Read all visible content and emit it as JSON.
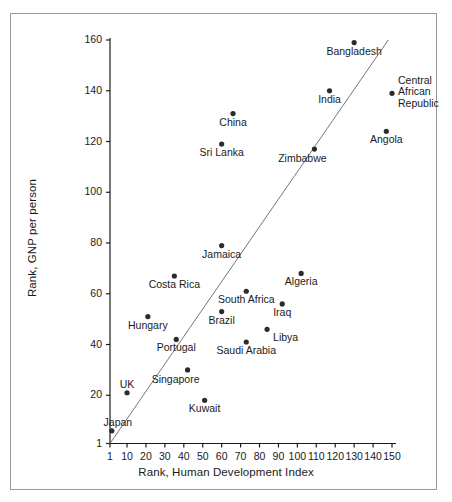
{
  "figure": {
    "background_color": "#ffffff",
    "frame_color": "#9a9a9a",
    "ink_color": "#1a1a1a",
    "marker_color": "#2b2b2b",
    "trend_line_color": "#767676"
  },
  "chart_data": {
    "type": "scatter",
    "title": "",
    "xlabel": "Rank, Human Development Index",
    "ylabel": "Rank, GNP per person",
    "xlim": [
      1,
      150
    ],
    "ylim": [
      1,
      160
    ],
    "grid": false,
    "legend": "none",
    "xticks": [
      1,
      10,
      20,
      30,
      40,
      50,
      60,
      70,
      80,
      90,
      100,
      110,
      120,
      130,
      140,
      150
    ],
    "xticklabels": [
      "1",
      "10",
      "20",
      "30",
      "40",
      "50",
      "60",
      "70",
      "80",
      "90",
      "100",
      "110",
      "120",
      "130",
      "140",
      "150"
    ],
    "yticks": [
      1,
      20,
      40,
      60,
      80,
      100,
      120,
      140,
      160
    ],
    "yticklabels": [
      "1",
      "20",
      "40",
      "60",
      "80",
      "100",
      "120",
      "140",
      "160"
    ],
    "trend_line": {
      "label": "y = x reference line",
      "x": [
        1,
        148
      ],
      "y": [
        1,
        160
      ]
    },
    "points": [
      {
        "label": "Japan",
        "x": 2,
        "y": 6,
        "label_pos": "above-left",
        "lines": [
          "Japan"
        ]
      },
      {
        "label": "UK",
        "x": 10,
        "y": 21,
        "label_pos": "above",
        "lines": [
          "UK"
        ]
      },
      {
        "label": "Hungary",
        "x": 21,
        "y": 51,
        "label_pos": "below",
        "lines": [
          "Hungary"
        ]
      },
      {
        "label": "Costa Rica",
        "x": 35,
        "y": 67,
        "label_pos": "below",
        "lines": [
          "Costa Rica"
        ]
      },
      {
        "label": "Portugal",
        "x": 36,
        "y": 42,
        "label_pos": "below",
        "lines": [
          "Portugal"
        ]
      },
      {
        "label": "Singapore",
        "x": 42,
        "y": 30,
        "label_pos": "below-left",
        "lines": [
          "Singapore"
        ]
      },
      {
        "label": "Kuwait",
        "x": 51,
        "y": 18,
        "label_pos": "below",
        "lines": [
          "Kuwait"
        ]
      },
      {
        "label": "Brazil",
        "x": 60,
        "y": 53,
        "label_pos": "below",
        "lines": [
          "Brazil"
        ]
      },
      {
        "label": "Sri Lanka",
        "x": 60,
        "y": 119,
        "label_pos": "below",
        "lines": [
          "Sri Lanka"
        ]
      },
      {
        "label": "Jamaica",
        "x": 60,
        "y": 79,
        "label_pos": "below",
        "lines": [
          "Jamaica"
        ]
      },
      {
        "label": "China",
        "x": 66,
        "y": 131,
        "label_pos": "below",
        "lines": [
          "China"
        ]
      },
      {
        "label": "South Africa",
        "x": 73,
        "y": 61,
        "label_pos": "below",
        "lines": [
          "South Africa"
        ]
      },
      {
        "label": "Saudi Arabia",
        "x": 73,
        "y": 41,
        "label_pos": "below",
        "lines": [
          "Saudi Arabia"
        ]
      },
      {
        "label": "Libya",
        "x": 84,
        "y": 46,
        "label_pos": "below-right",
        "lines": [
          "Libya"
        ]
      },
      {
        "label": "Iraq",
        "x": 92,
        "y": 56,
        "label_pos": "below",
        "lines": [
          "Iraq"
        ]
      },
      {
        "label": "Algeria",
        "x": 102,
        "y": 68,
        "label_pos": "below",
        "lines": [
          "Algeria"
        ]
      },
      {
        "label": "Zimbabwe",
        "x": 109,
        "y": 117,
        "label_pos": "below-left",
        "lines": [
          "Zimbabwe"
        ]
      },
      {
        "label": "India",
        "x": 117,
        "y": 140,
        "label_pos": "below",
        "lines": [
          "India"
        ]
      },
      {
        "label": "Bangladesh",
        "x": 130,
        "y": 159,
        "label_pos": "below",
        "lines": [
          "Bangladesh"
        ]
      },
      {
        "label": "Angola",
        "x": 147,
        "y": 124,
        "label_pos": "below",
        "lines": [
          "Angola"
        ]
      },
      {
        "label": "Central African Republic",
        "x": 150,
        "y": 139,
        "label_pos": "right",
        "lines": [
          "Central",
          "African",
          "Republic"
        ]
      }
    ]
  }
}
